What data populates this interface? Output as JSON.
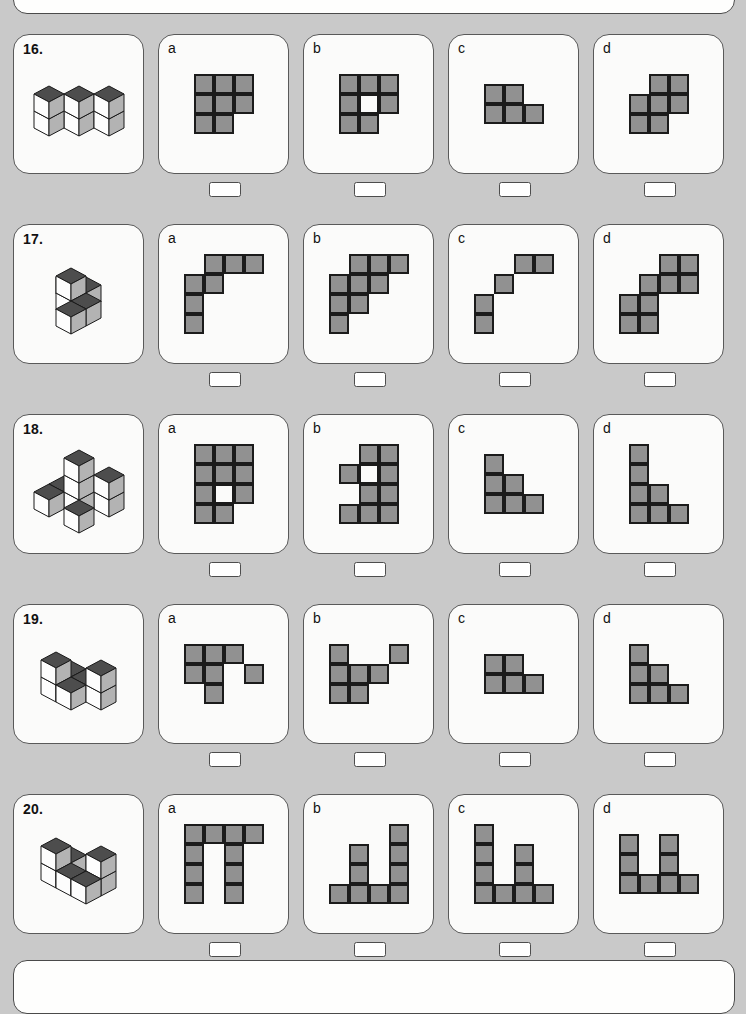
{
  "page": {
    "background_color": "#c9c9c9",
    "card_color": "#fbfbfa",
    "cell_fill_color": "#919191",
    "cell_stroke_color": "#1b1b1b",
    "cube_top_color": "#4d4d4d",
    "cube_left_color": "#fdfdfd",
    "cube_right_color": "#b3b3b3"
  },
  "option_labels": [
    "a",
    "b",
    "c",
    "d"
  ],
  "questions": [
    {
      "number": "16.",
      "figure": "isometric-cube-stack-16",
      "options": [
        {
          "label": "a",
          "cols": 3,
          "rows": 3,
          "cells": [
            1,
            1,
            1,
            1,
            1,
            1,
            1,
            1,
            0
          ]
        },
        {
          "label": "b",
          "cols": 3,
          "rows": 3,
          "cells": [
            1,
            1,
            1,
            1,
            2,
            1,
            1,
            1,
            0
          ]
        },
        {
          "label": "c",
          "cols": 3,
          "rows": 2,
          "cells": [
            1,
            1,
            0,
            1,
            1,
            1
          ]
        },
        {
          "label": "d",
          "cols": 3,
          "rows": 3,
          "cells": [
            0,
            1,
            1,
            1,
            1,
            1,
            1,
            1,
            0
          ]
        }
      ]
    },
    {
      "number": "17.",
      "figure": "isometric-cube-stack-17",
      "options": [
        {
          "label": "a",
          "cols": 4,
          "rows": 4,
          "cells": [
            0,
            1,
            1,
            1,
            1,
            1,
            0,
            0,
            1,
            0,
            0,
            0,
            1,
            0,
            0,
            0
          ]
        },
        {
          "label": "b",
          "cols": 4,
          "rows": 4,
          "cells": [
            0,
            1,
            1,
            1,
            1,
            1,
            1,
            0,
            1,
            1,
            0,
            0,
            1,
            0,
            0,
            0
          ]
        },
        {
          "label": "c",
          "cols": 4,
          "rows": 4,
          "cells": [
            0,
            0,
            1,
            1,
            0,
            1,
            0,
            0,
            1,
            0,
            0,
            0,
            1,
            0,
            0,
            0
          ]
        },
        {
          "label": "d",
          "cols": 4,
          "rows": 4,
          "cells": [
            0,
            0,
            1,
            1,
            0,
            1,
            1,
            1,
            1,
            1,
            0,
            0,
            1,
            1,
            0,
            0
          ]
        }
      ]
    },
    {
      "number": "18.",
      "figure": "isometric-cube-stack-18",
      "options": [
        {
          "label": "a",
          "cols": 3,
          "rows": 4,
          "cells": [
            1,
            1,
            1,
            1,
            1,
            1,
            1,
            2,
            1,
            1,
            1,
            0
          ]
        },
        {
          "label": "b",
          "cols": 3,
          "rows": 4,
          "cells": [
            0,
            1,
            1,
            1,
            2,
            1,
            0,
            1,
            1,
            1,
            1,
            1
          ]
        },
        {
          "label": "c",
          "cols": 3,
          "rows": 3,
          "cells": [
            1,
            0,
            0,
            1,
            1,
            0,
            1,
            1,
            1
          ]
        },
        {
          "label": "d",
          "cols": 3,
          "rows": 4,
          "cells": [
            1,
            0,
            0,
            1,
            0,
            0,
            1,
            1,
            0,
            1,
            1,
            1
          ]
        }
      ]
    },
    {
      "number": "19.",
      "figure": "isometric-cube-stack-19",
      "options": [
        {
          "label": "a",
          "cols": 4,
          "rows": 3,
          "cells": [
            1,
            1,
            1,
            0,
            1,
            1,
            0,
            1,
            0,
            1,
            0,
            0
          ]
        },
        {
          "label": "b",
          "cols": 4,
          "rows": 3,
          "cells": [
            1,
            0,
            0,
            1,
            1,
            1,
            1,
            0,
            1,
            1,
            0,
            0
          ]
        },
        {
          "label": "c",
          "cols": 3,
          "rows": 2,
          "cells": [
            1,
            1,
            0,
            1,
            1,
            1
          ]
        },
        {
          "label": "d",
          "cols": 3,
          "rows": 3,
          "cells": [
            1,
            0,
            0,
            1,
            1,
            0,
            1,
            1,
            1
          ]
        }
      ]
    },
    {
      "number": "20.",
      "figure": "isometric-cube-stack-20",
      "options": [
        {
          "label": "a",
          "cols": 4,
          "rows": 4,
          "cells": [
            1,
            1,
            1,
            1,
            1,
            0,
            1,
            0,
            1,
            0,
            1,
            0,
            1,
            0,
            1,
            0
          ]
        },
        {
          "label": "b",
          "cols": 4,
          "rows": 4,
          "cells": [
            0,
            0,
            0,
            1,
            0,
            1,
            0,
            1,
            0,
            1,
            0,
            1,
            1,
            1,
            1,
            1
          ]
        },
        {
          "label": "c",
          "cols": 4,
          "rows": 4,
          "cells": [
            1,
            0,
            0,
            0,
            1,
            0,
            1,
            0,
            1,
            0,
            1,
            0,
            1,
            1,
            1,
            1
          ]
        },
        {
          "label": "d",
          "cols": 4,
          "rows": 3,
          "cells": [
            1,
            0,
            1,
            0,
            1,
            0,
            1,
            0,
            1,
            1,
            1,
            1
          ]
        }
      ]
    }
  ]
}
